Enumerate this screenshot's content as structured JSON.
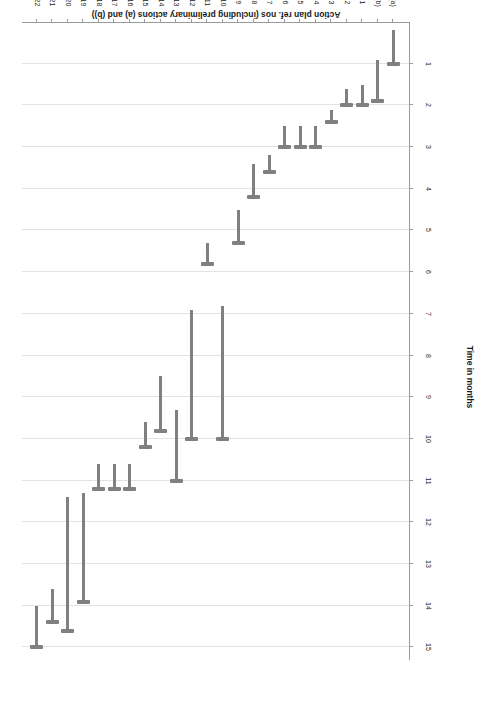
{
  "chart_data": {
    "type": "bar",
    "orientation": "horizontal-gantt",
    "title": "",
    "xlabel": "Action plan ref. nos (including preliminary actions (a) and (b))",
    "ylabel": "Time in months",
    "categories": [
      "(a)",
      "(b)",
      "1",
      "2",
      "3",
      "4",
      "5",
      "6",
      "7",
      "8",
      "9",
      "10",
      "11",
      "12",
      "13",
      "14",
      "15",
      "16",
      "17",
      "18",
      "19",
      "20",
      "21",
      "22"
    ],
    "value_ticks": [
      1,
      2,
      3,
      4,
      5,
      6,
      7,
      8,
      9,
      10,
      11,
      12,
      13,
      14,
      15
    ],
    "ylim": [
      0,
      15.3
    ],
    "grid": true,
    "legend": "none",
    "series": [
      {
        "name": "Action duration",
        "starts": [
          0.2,
          0.9,
          1.5,
          1.6,
          2.1,
          2.5,
          2.5,
          2.5,
          3.2,
          3.4,
          4.5,
          6.8,
          5.3,
          6.9,
          9.3,
          8.5,
          9.6,
          10.6,
          10.6,
          10.6,
          11.3,
          11.4,
          13.6,
          14.0
        ],
        "ends": [
          1.0,
          1.9,
          2.0,
          2.0,
          2.4,
          3.0,
          3.0,
          3.0,
          3.6,
          4.2,
          5.3,
          10.0,
          5.8,
          10.0,
          11.0,
          9.8,
          10.2,
          11.2,
          11.2,
          11.2,
          13.9,
          14.6,
          14.4,
          15.0
        ]
      }
    ]
  },
  "axes": {
    "value_axis_title": "Time in months",
    "category_axis_title": "Action plan ref. nos (including preliminary actions (a) and (b))"
  }
}
